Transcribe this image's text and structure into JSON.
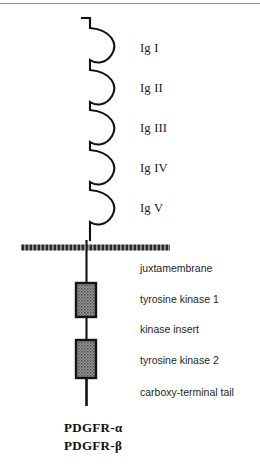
{
  "figure": {
    "top_rule": true
  },
  "ig_domains": [
    {
      "label": "Ig I",
      "y": 48
    },
    {
      "label": "Ig II",
      "y": 88
    },
    {
      "label": "Ig III",
      "y": 128
    },
    {
      "label": "Ig IV",
      "y": 168
    },
    {
      "label": "Ig V",
      "y": 208
    }
  ],
  "membrane": {
    "name": "plasma-membrane",
    "x1": 21,
    "x2": 170,
    "y": 248,
    "color": "#2b2b2b"
  },
  "intracellular_labels": [
    {
      "label": "juxtamembrane",
      "y": 270
    },
    {
      "label": "tyrosine kinase 1",
      "y": 300
    },
    {
      "label": "kinase insert",
      "y": 330
    },
    {
      "label": "tyrosine kinase 2",
      "y": 360
    },
    {
      "label": "carboxy-terminal tail",
      "y": 392
    }
  ],
  "kinase_boxes": [
    {
      "name": "tyrosine-kinase-1-box",
      "x": 76,
      "y": 283,
      "width": 20,
      "height": 34
    },
    {
      "name": "tyrosine-kinase-2-box",
      "x": 76,
      "y": 340,
      "width": 20,
      "height": 38
    }
  ],
  "receptor_names": [
    {
      "label": "PDGFR-α",
      "y": 428
    },
    {
      "label": "PDGFR-β",
      "y": 446
    }
  ],
  "colors": {
    "stroke": "#111111",
    "membrane": "#2b2b2b",
    "box_border": "#141414",
    "box_fill": "#8d8d8d",
    "rule": "#8a8a8a",
    "background": "#ffffff"
  },
  "caption": {
    "clipped_fragment": ""
  }
}
